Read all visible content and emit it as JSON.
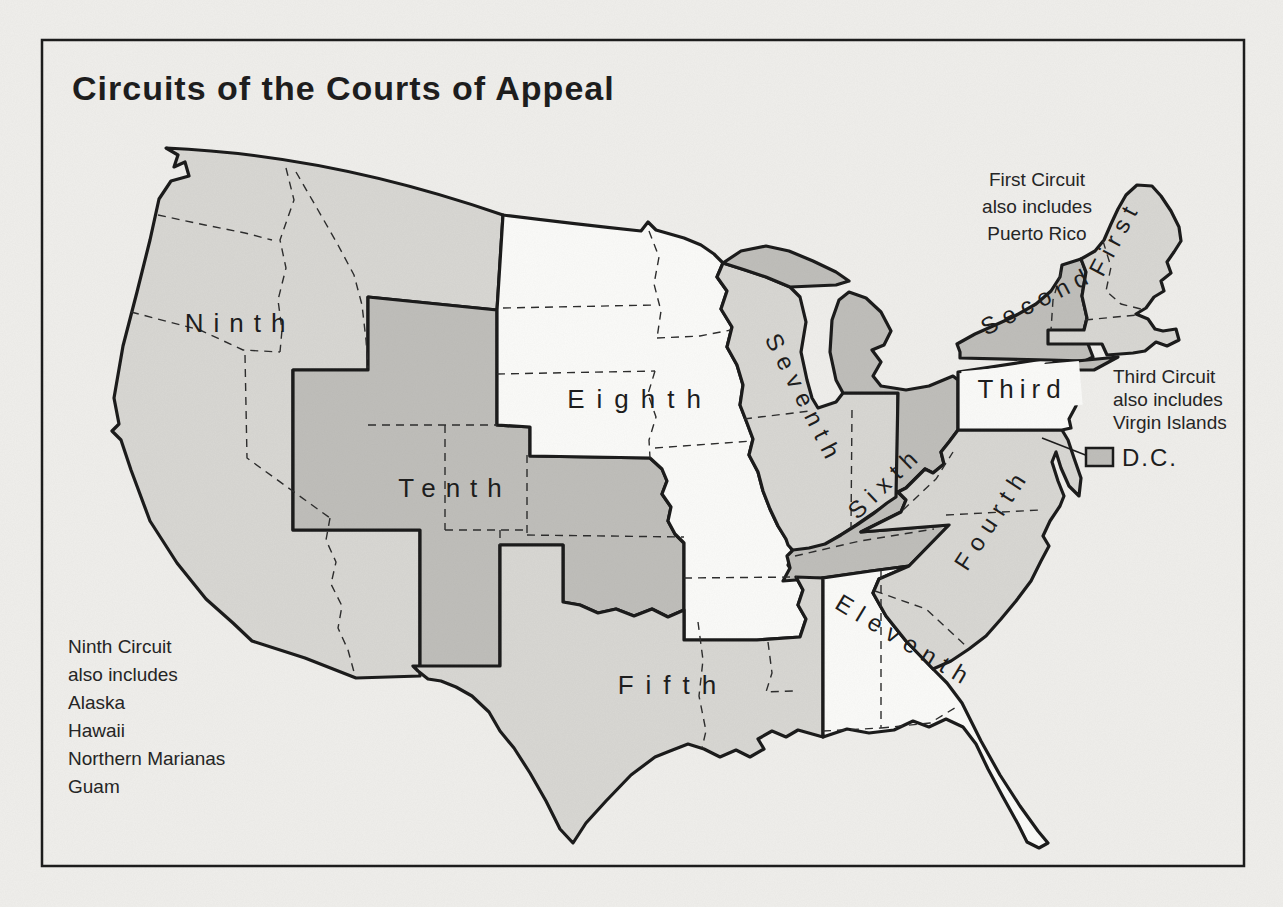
{
  "title": "Circuits of the Courts of Appeal",
  "map": {
    "region_labels": {
      "first": "First",
      "second": "Second",
      "third": "Third",
      "fourth": "Fourth",
      "fifth": "Fifth",
      "sixth": "Sixth",
      "seventh": "Seventh",
      "eighth": "Eighth",
      "ninth": "Ninth",
      "tenth": "Tenth",
      "eleventh": "Eleventh",
      "dc": "D.C."
    },
    "notes": {
      "first": {
        "lines": [
          "First Circuit",
          "also includes",
          "Puerto Rico"
        ]
      },
      "third": {
        "lines": [
          "Third Circuit",
          "also includes",
          "Virgin Islands"
        ]
      },
      "ninth": {
        "lines": [
          "Ninth Circuit",
          "also includes",
          "Alaska",
          "Hawaii",
          "Northern Marianas",
          "Guam"
        ]
      }
    },
    "colors": {
      "background": "#efeeeb",
      "white_region": "#fbfbf9",
      "light_gray_region": "#d8d7d3",
      "dark_gray_region": "#bfbeba",
      "line": "#1a1a1a"
    },
    "shading": {
      "light_gray_circuits": [
        "First",
        "Fourth",
        "Fifth",
        "Seventh",
        "Ninth"
      ],
      "dark_gray_circuits": [
        "Second",
        "Sixth",
        "Tenth",
        "D.C."
      ],
      "white_circuits": [
        "Third",
        "Eighth",
        "Eleventh"
      ]
    }
  }
}
